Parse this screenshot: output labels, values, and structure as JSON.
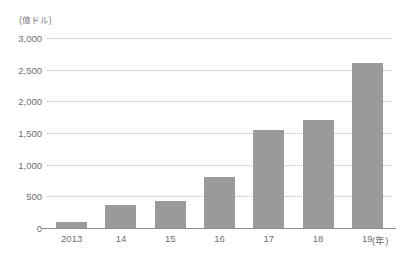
{
  "chart_data": {
    "type": "bar",
    "title": "",
    "subtitle": "",
    "unit_label": "(億ドル)",
    "xlabel": "(年)",
    "ylabel": "",
    "categories": [
      "2013",
      "14",
      "15",
      "16",
      "17",
      "18",
      "19"
    ],
    "values": [
      100,
      360,
      420,
      800,
      1550,
      1700,
      2600
    ],
    "series": [
      {
        "name": "",
        "values": [
          100,
          360,
          420,
          800,
          1550,
          1700,
          2600
        ]
      }
    ],
    "ylim": [
      0,
      3000
    ],
    "y_ticks": [
      0,
      500,
      1000,
      1500,
      2000,
      2500,
      3000
    ],
    "y_tick_labels": [
      "0",
      "500",
      "1,000",
      "1,500",
      "2,000",
      "2,500",
      "3,000"
    ],
    "grid": true,
    "grid_style": "dotted",
    "legend": false,
    "legend_position": "none",
    "annotations": [],
    "colors": {
      "bar_fill": "#9a9a9a",
      "gridline": "#b9b9b9",
      "axis_line": "#8e8e8e",
      "tick_text": "#6f6f6f",
      "unit_text": "#787878",
      "background": "#ffffff"
    }
  }
}
